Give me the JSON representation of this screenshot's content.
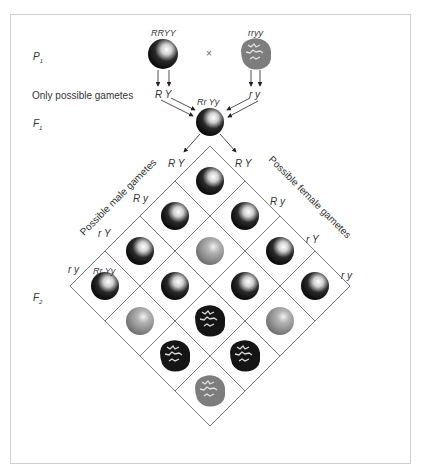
{
  "diagram": {
    "generations": {
      "p1": "P",
      "p1_sub": "1",
      "f1": "F",
      "f1_sub": "1",
      "f2": "F",
      "f2_sub": "2"
    },
    "parents": {
      "left_genotype": "RRYY",
      "right_genotype": "rryy",
      "cross_symbol": "×"
    },
    "gametes_label": "Only possible gametes",
    "parent_gametes": {
      "left": "R  Y",
      "right": "r  y"
    },
    "f1_genotype": "Rr Yy",
    "male_gametes_label": "Possible male gametes",
    "female_gametes_label": "Possible female gametes",
    "male_gametes": [
      "R  Y",
      "R  y",
      "r  Y",
      "r  y"
    ],
    "female_gametes": [
      "R  Y",
      "R  y",
      "r  Y",
      "r  y"
    ],
    "example_cell_genotype": "Rr Yy",
    "colors": {
      "yellow_seed": "#111111",
      "green_seed": "#8a8a8a",
      "grid_line": "#555555",
      "frame": "#cfcfcf"
    },
    "grid_rows": [
      [
        "round-yellow",
        "round-yellow",
        "round-yellow",
        "round-yellow"
      ],
      [
        "round-yellow",
        "round-green",
        "round-yellow",
        "round-green"
      ],
      [
        "round-yellow",
        "round-yellow",
        "wrinkled-yellow",
        "wrinkled-yellow"
      ],
      [
        "round-yellow",
        "round-green",
        "wrinkled-yellow",
        "wrinkled-green"
      ]
    ]
  }
}
